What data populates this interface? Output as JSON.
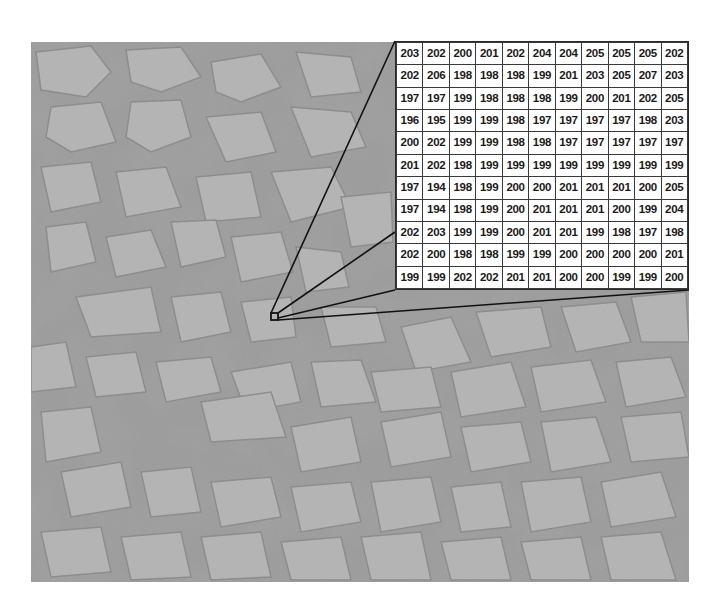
{
  "figure": {
    "inset_marker": {
      "x": 271,
      "y": 313,
      "size": 7
    },
    "inset_grid": {
      "rows": 11,
      "cols": 11,
      "values": [
        [
          "203",
          "202",
          "200",
          "201",
          "202",
          "204",
          "204",
          "205",
          "205",
          "205",
          "202"
        ],
        [
          "202",
          "206",
          "198",
          "198",
          "198",
          "199",
          "201",
          "203",
          "205",
          "207",
          "203"
        ],
        [
          "197",
          "197",
          "199",
          "198",
          "198",
          "198",
          "199",
          "200",
          "201",
          "202",
          "205"
        ],
        [
          "196",
          "195",
          "199",
          "199",
          "198",
          "197",
          "197",
          "197",
          "197",
          "198",
          "203"
        ],
        [
          "200",
          "202",
          "199",
          "199",
          "198",
          "198",
          "197",
          "197",
          "197",
          "197",
          "197"
        ],
        [
          "201",
          "202",
          "198",
          "199",
          "199",
          "199",
          "199",
          "199",
          "199",
          "199",
          "199"
        ],
        [
          "197",
          "194",
          "198",
          "199",
          "200",
          "200",
          "201",
          "201",
          "201",
          "200",
          "205"
        ],
        [
          "197",
          "194",
          "198",
          "199",
          "200",
          "201",
          "201",
          "201",
          "200",
          "199",
          "204"
        ],
        [
          "202",
          "203",
          "199",
          "199",
          "200",
          "201",
          "201",
          "199",
          "198",
          "197",
          "198"
        ],
        [
          "202",
          "200",
          "198",
          "198",
          "199",
          "199",
          "200",
          "200",
          "200",
          "200",
          "201"
        ],
        [
          "199",
          "199",
          "202",
          "202",
          "201",
          "201",
          "200",
          "200",
          "199",
          "199",
          "200"
        ]
      ]
    }
  },
  "colors": {
    "background": "#ffffff",
    "ice": "#c4c4c4",
    "water": "#8e8e8e",
    "line": "#111111"
  }
}
